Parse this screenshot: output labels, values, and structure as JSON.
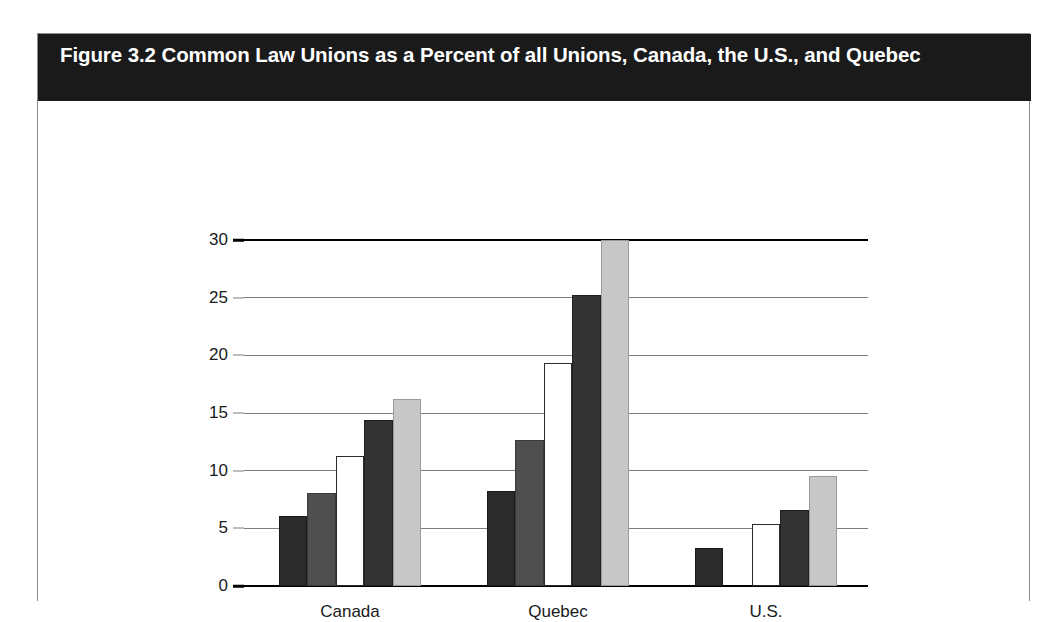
{
  "figure": {
    "title": "Figure 3.2 Common Law Unions as a Percent of all Unions, Canada, the U.S., and Quebec"
  },
  "chart_data": {
    "type": "bar",
    "title": "Figure 3.2 Common Law Unions as a Percent of all Unions, Canada, the U.S., and Quebec",
    "xlabel": "",
    "ylabel": "",
    "ylim": [
      0,
      30
    ],
    "ytick_step": 5,
    "ytick_labels": [
      "0",
      "5",
      "10",
      "15",
      "20",
      "25",
      "30"
    ],
    "grid": true,
    "legend": "none",
    "clipped_note": "Quebec series-5 bar extends beyond the top of the 30 axis and is clipped.",
    "categories": [
      "Canada",
      "Quebec",
      "U.S."
    ],
    "series": [
      {
        "name": "Series 1",
        "color": "#2b2b2b",
        "values": [
          6.1,
          8.2,
          3.3
        ]
      },
      {
        "name": "Series 2",
        "color": "#4f4f4f",
        "values": [
          8.1,
          12.7,
          0
        ]
      },
      {
        "name": "Series 3",
        "color": "#ffffff",
        "values": [
          11.3,
          19.3,
          5.4
        ]
      },
      {
        "name": "Series 4",
        "color": "#333333",
        "values": [
          14.4,
          25.2,
          6.6
        ]
      },
      {
        "name": "Series 5",
        "color": "#c7c7c7",
        "values": [
          16.2,
          30.6,
          9.5
        ]
      }
    ]
  }
}
